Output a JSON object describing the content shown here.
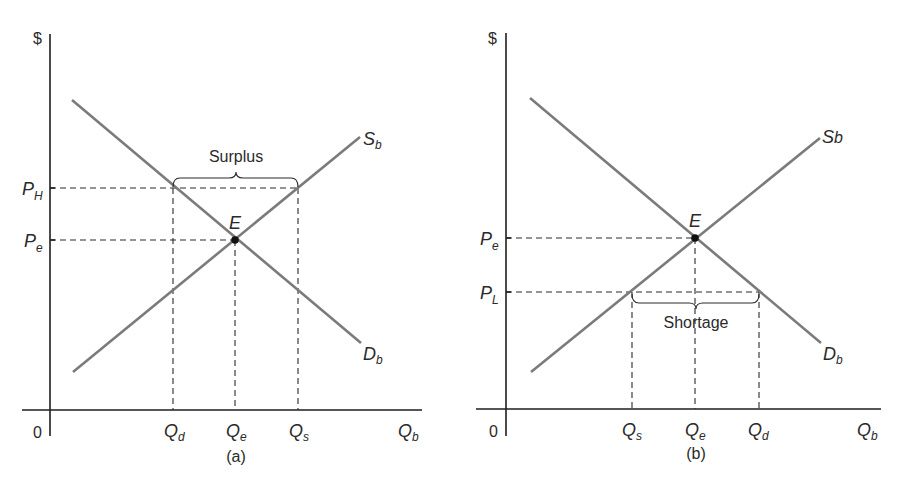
{
  "figure": {
    "panels": [
      {
        "id": "a",
        "caption": "(a)",
        "y_axis_label": "$",
        "origin_label": "0",
        "x_axis_label": {
          "main": "Q",
          "sub": "b"
        },
        "supply_label": {
          "main": "S",
          "sub": "b"
        },
        "demand_label": {
          "main": "D",
          "sub": "b"
        },
        "equilibrium_label": "E",
        "price_labels": [
          {
            "main": "P",
            "sub": "H"
          },
          {
            "main": "P",
            "sub": "e"
          }
        ],
        "quantity_labels": [
          {
            "main": "Q",
            "sub": "d"
          },
          {
            "main": "Q",
            "sub": "e"
          },
          {
            "main": "Q",
            "sub": "s"
          }
        ],
        "gap_label": "Surplus"
      },
      {
        "id": "b",
        "caption": "(b)",
        "y_axis_label": "$",
        "origin_label": "0",
        "x_axis_label": {
          "main": "Q",
          "sub": "b"
        },
        "supply_label": {
          "main": "S",
          "sub": "b"
        },
        "demand_label": {
          "main": "D",
          "sub": "b"
        },
        "equilibrium_label": "E",
        "price_labels": [
          {
            "main": "P",
            "sub": "e"
          },
          {
            "main": "P",
            "sub": "L"
          }
        ],
        "quantity_labels": [
          {
            "main": "Q",
            "sub": "s"
          },
          {
            "main": "Q",
            "sub": "e"
          },
          {
            "main": "Q",
            "sub": "d"
          }
        ],
        "gap_label": "Shortage"
      }
    ],
    "colors": {
      "curve": "#7b7b7b",
      "axis": "#1e1e1e",
      "guide": "#2a2a2a",
      "background": "#ffffff"
    }
  }
}
